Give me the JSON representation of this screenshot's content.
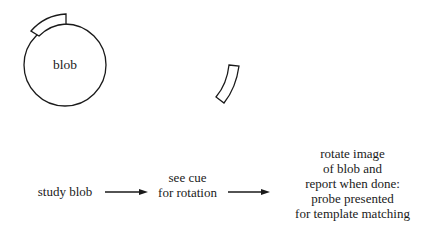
{
  "blob": {
    "label": "blob"
  },
  "flow": {
    "steps": [
      {
        "lines": [
          "study blob"
        ]
      },
      {
        "lines": [
          "see cue",
          "for rotation"
        ]
      },
      {
        "lines": [
          "rotate image",
          "of blob and",
          "report when done:",
          "probe presented",
          "for template matching"
        ]
      }
    ],
    "arrows": 2
  },
  "colors": {
    "stroke": "#1a1a1a",
    "background": "#ffffff"
  }
}
